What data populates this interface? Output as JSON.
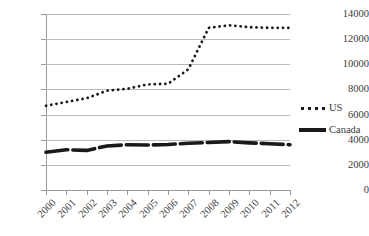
{
  "chart_data": {
    "type": "line",
    "title": "",
    "subtitle": "",
    "xlabel": "",
    "ylabel": "",
    "categories": [
      "2000",
      "2001",
      "2002",
      "2003",
      "2004",
      "2005",
      "2006",
      "2007",
      "2008",
      "2009",
      "2010",
      "2011",
      "2012"
    ],
    "yticks": [
      "0",
      "2000",
      "4000",
      "6000",
      "8000",
      "10000",
      "12000",
      "14000"
    ],
    "ylim": [
      0,
      14000
    ],
    "grid": true,
    "legend_position": "right",
    "series": [
      {
        "name": "US",
        "style": "dotted",
        "color": "#1a1a1a",
        "values": [
          6700,
          7000,
          7300,
          7900,
          8050,
          8400,
          8450,
          9600,
          12900,
          13100,
          12950,
          12900,
          12900
        ]
      },
      {
        "name": "Canada",
        "style": "solid-thick",
        "color": "#1a1a1a",
        "values": [
          3000,
          3200,
          3150,
          3500,
          3600,
          3580,
          3620,
          3720,
          3780,
          3850,
          3750,
          3680,
          3600
        ]
      }
    ]
  },
  "legend": {
    "items": [
      {
        "label": "US",
        "marker": "dotted-line-marker"
      },
      {
        "label": "Canada",
        "marker": "solid-line-marker"
      }
    ]
  },
  "colors": {
    "series": "#1a1a1a",
    "gridline": "#b9b9b9",
    "axis": "#9a9a9a",
    "text": "#3a3a3a",
    "background": "#ffffff"
  }
}
